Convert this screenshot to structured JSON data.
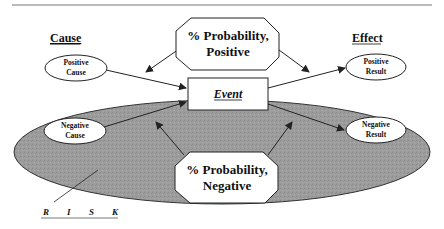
{
  "diagram": {
    "column_headers": {
      "cause": "Cause",
      "effect": "Effect"
    },
    "probability_positive": {
      "line1": "% Probability,",
      "line2": "Positive"
    },
    "probability_negative": {
      "line1": "% Probability,",
      "line2": "Negative"
    },
    "event": "Event",
    "positive_cause": {
      "line1": "Positive",
      "line2": "Cause"
    },
    "negative_cause": {
      "line1": "Negative",
      "line2": "Cause"
    },
    "positive_result": {
      "line1": "Positive",
      "line2": "Result"
    },
    "negative_result": {
      "line1": "Negative",
      "line2": "Result"
    },
    "risk_label": [
      "R",
      "I",
      "S",
      "K"
    ],
    "colors": {
      "risk_region": "#9a9a9a",
      "line": "#222222",
      "box_fill": "#ffffff"
    }
  }
}
